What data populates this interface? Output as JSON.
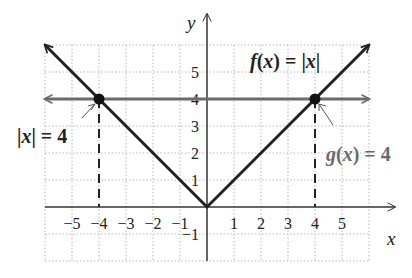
{
  "chart_data": {
    "type": "line",
    "title": "",
    "xlabel": "x",
    "ylabel": "y",
    "xlim": [
      -6,
      6
    ],
    "ylim": [
      -2,
      6
    ],
    "grid": true,
    "grid_style": "dotted",
    "x_ticks": [
      "−5",
      "−4",
      "−3",
      "−2",
      "−1",
      "1",
      "2",
      "3",
      "4",
      "5"
    ],
    "x_tick_values": [
      -5,
      -4,
      -3,
      -2,
      -1,
      1,
      2,
      3,
      4,
      5
    ],
    "y_ticks": [
      "−1",
      "1",
      "2",
      "3",
      "4",
      "5"
    ],
    "y_tick_values": [
      -1,
      1,
      2,
      3,
      4,
      5
    ],
    "series": [
      {
        "name": "f(x) = |x|",
        "color": "#222222",
        "points": [
          [
            -6,
            6
          ],
          [
            0,
            0
          ],
          [
            6,
            6
          ]
        ],
        "arrows": "both"
      },
      {
        "name": "g(x) = 4",
        "color": "#6b6b6b",
        "points": [
          [
            -6,
            4
          ],
          [
            6,
            4
          ]
        ],
        "arrows": "both"
      }
    ],
    "intersection_points": [
      [
        -4,
        4
      ],
      [
        4,
        4
      ]
    ],
    "dashed_verticals": [
      -4,
      4
    ],
    "annotations": [
      {
        "text": "f(x) = |x|",
        "x": 1.6,
        "y": 5.3,
        "color": "#222222"
      },
      {
        "text": "g(x) = 4",
        "x": 4.2,
        "y": 3.1,
        "color": "#6b6b6b",
        "points_to": [
          4,
          4
        ]
      },
      {
        "text": "|x| = 4",
        "x": -7.5,
        "y": 2.9,
        "color": "#222222",
        "points_to": [
          -4,
          4
        ]
      }
    ]
  },
  "labels": {
    "x_axis": "x",
    "y_axis": "y",
    "f_label": "f(x) = |x|",
    "g_label": "g(x) = 4",
    "eq_label": "|x| = 4"
  },
  "colors": {
    "f_line": "#222222",
    "g_line": "#6b6b6b",
    "grid": "#b8b8b8",
    "axis": "#333333"
  }
}
